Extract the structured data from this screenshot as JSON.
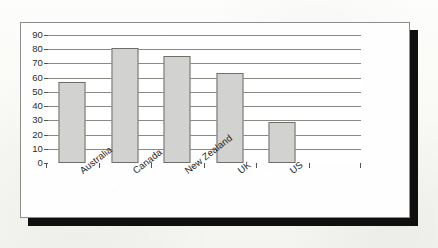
{
  "figure": {
    "border_color": "#8d8d8d",
    "shadow_color": "#100f0d",
    "page_background": "#f8f8f5"
  },
  "chart_data": {
    "type": "bar",
    "title": "",
    "subtitle": "",
    "xlabel": "",
    "ylabel": "",
    "categories": [
      "Australia",
      "Canada",
      "New Zealand",
      "UK",
      "US"
    ],
    "values": [
      57,
      81,
      75,
      63,
      29
    ],
    "series": [
      {
        "name": "",
        "values": [
          57,
          81,
          75,
          63,
          29
        ]
      }
    ],
    "ylim": [
      0,
      90
    ],
    "y_ticks": [
      0,
      10,
      20,
      30,
      40,
      50,
      60,
      70,
      80,
      90
    ],
    "y_tick_labels": [
      "0",
      "10",
      "20",
      "30",
      "40",
      "50",
      "60",
      "70",
      "80",
      "90"
    ],
    "grid": true,
    "grid_axis": "y",
    "legend": false,
    "legend_position": "none",
    "category_slots": 6,
    "empty_trailing_slot": true,
    "bar_fill_color": "#d2d2d0",
    "bar_edge_color": "#6f6e6a",
    "gridline_color": "#8a8984",
    "axis_color": "#55544f",
    "x_label_rotation_degrees": -38,
    "annotations": []
  }
}
